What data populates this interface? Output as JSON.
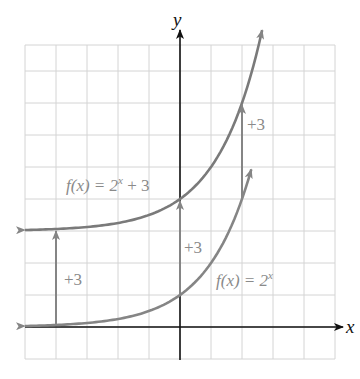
{
  "chart_data": {
    "type": "line",
    "title": "",
    "xlabel": "x",
    "ylabel": "y",
    "xlim": [
      -5,
      5
    ],
    "ylim": [
      -1,
      9
    ],
    "grid": true,
    "tick_labels_shown": false,
    "series": [
      {
        "name": "f(x) = 2^x",
        "label_text": "f(x) = 2",
        "label_exp": "x",
        "function": "2^x",
        "x_range": [
          -5,
          2.3
        ],
        "color": "#8a8a8a"
      },
      {
        "name": "f(x) = 2^x + 3",
        "label_text": "f(x) = 2",
        "label_exp": "x",
        "label_tail": " + 3",
        "function": "2^x + 3",
        "x_range": [
          -5,
          2.65
        ],
        "color": "#7a7a7a"
      }
    ],
    "annotations": [
      {
        "type": "arrow",
        "x": -4,
        "from_y": 0.0625,
        "to_y": 3.0625,
        "text": "+3"
      },
      {
        "type": "arrow",
        "x": 0,
        "from_y": 1,
        "to_y": 4,
        "text": "+3"
      },
      {
        "type": "arrow",
        "x": 2,
        "from_y": 4,
        "to_y": 7,
        "text": "+3"
      }
    ]
  },
  "axes": {
    "x_label": "x",
    "y_label": "y"
  },
  "labels": {
    "upper_curve": {
      "f": "f(x) = 2",
      "exp": "x",
      "tail": " + 3"
    },
    "lower_curve": {
      "f": "f(x) = 2",
      "exp": "x"
    },
    "shift_left": "+3",
    "shift_mid": "+3",
    "shift_right": "+3"
  },
  "colors": {
    "grid": "#d4d4d4",
    "axis": "#111111",
    "curve": "#858585",
    "text": "#8a8a8a"
  }
}
